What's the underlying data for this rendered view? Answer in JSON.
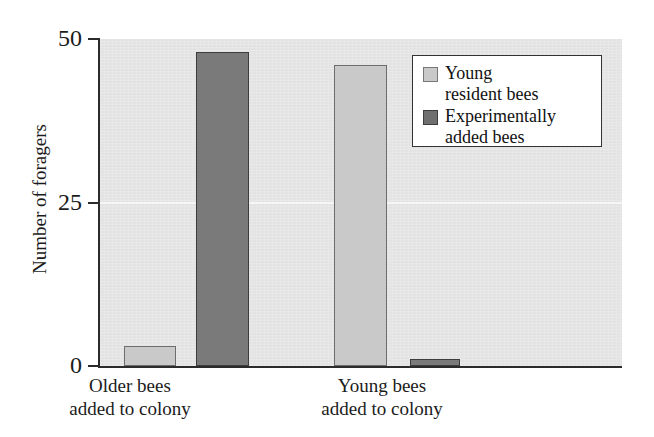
{
  "chart_data": {
    "type": "bar",
    "title": "",
    "xlabel": "",
    "ylabel": "Number of foragers",
    "categories": [
      "Older bees added to colony",
      "Young bees added to colony"
    ],
    "category_lines": [
      [
        "Older bees",
        "added to colony"
      ],
      [
        "Young bees",
        "added to colony"
      ]
    ],
    "series": [
      {
        "name": "Young resident bees",
        "name_lines": [
          "Young",
          "resident bees"
        ],
        "color": "#c9c9c9",
        "values": [
          3,
          46
        ]
      },
      {
        "name": "Experimentally added bees",
        "name_lines": [
          "Experimentally",
          "added bees"
        ],
        "color": "#7a7a7a",
        "values": [
          48,
          1
        ]
      }
    ],
    "ylim": [
      0,
      50
    ],
    "yticks": [
      0,
      25,
      50
    ],
    "ytick_labels": [
      "0",
      "25",
      "50"
    ],
    "grid": true,
    "gridlines_at": [
      25
    ],
    "legend_position": "top-right",
    "plot_background": "#e3e3e3",
    "axis_color": "#2b2b2b"
  }
}
